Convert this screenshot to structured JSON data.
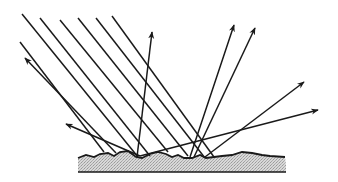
{
  "diagram": {
    "title": "Diffuse reflection from a rough surface",
    "colors": {
      "background": "#ffffff",
      "ray": "#1a1a1a",
      "surface_fill": "#cfcfcf",
      "surface_outline": "#1a1a1a"
    },
    "incident_rays": [
      {
        "x1": 20,
        "y1": 42,
        "x2": 104,
        "y2": 152
      },
      {
        "x1": 22,
        "y1": 14,
        "x2": 138,
        "y2": 157
      },
      {
        "x1": 40,
        "y1": 18,
        "x2": 150,
        "y2": 156
      },
      {
        "x1": 60,
        "y1": 20,
        "x2": 168,
        "y2": 152
      },
      {
        "x1": 78,
        "y1": 18,
        "x2": 188,
        "y2": 156
      },
      {
        "x1": 96,
        "y1": 18,
        "x2": 205,
        "y2": 158
      },
      {
        "x1": 112,
        "y1": 16,
        "x2": 214,
        "y2": 157
      }
    ],
    "reflected_rays": [
      {
        "x1": 116,
        "y1": 153,
        "x2": 25,
        "y2": 58
      },
      {
        "x1": 140,
        "y1": 156,
        "x2": 66,
        "y2": 124
      },
      {
        "x1": 137,
        "y1": 157,
        "x2": 152,
        "y2": 32
      },
      {
        "x1": 190,
        "y1": 157,
        "x2": 234,
        "y2": 25
      },
      {
        "x1": 194,
        "y1": 157,
        "x2": 255,
        "y2": 28
      },
      {
        "x1": 205,
        "y1": 157,
        "x2": 304,
        "y2": 82
      },
      {
        "x1": 140,
        "y1": 156,
        "x2": 318,
        "y2": 110
      }
    ],
    "surface": {
      "top_path": "M78,158 L86,155 L94,157 L100,154 L108,153 L114,156 L120,152 L128,151 L136,157 L142,158 L150,154 L158,152 L166,154 L172,157 L178,155 L184,158 L192,158 L200,155 L206,158 L214,157 L222,156 L232,155 L242,152 L252,153 L262,155 L270,156 L285,157 L286,165",
      "bottom_y": 172,
      "left_x": 78,
      "right_x": 286
    }
  }
}
